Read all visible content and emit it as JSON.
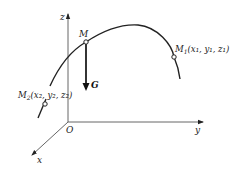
{
  "figure": {
    "axes": {
      "z_label": "z",
      "y_label": "y",
      "x_label": "x",
      "origin_label": "O"
    },
    "points": {
      "M": {
        "label": "M"
      },
      "M1": {
        "label_main": "M",
        "label_sub": "1",
        "coords": "(x₁, y₁, z₁)"
      },
      "M2": {
        "label_main": "M",
        "label_sub": "2",
        "coords": "(x₂, y₂, z₂)"
      }
    },
    "force": {
      "label": "G"
    },
    "colors": {
      "line": "#222222",
      "axis": "#555555",
      "background": "#ffffff"
    }
  }
}
